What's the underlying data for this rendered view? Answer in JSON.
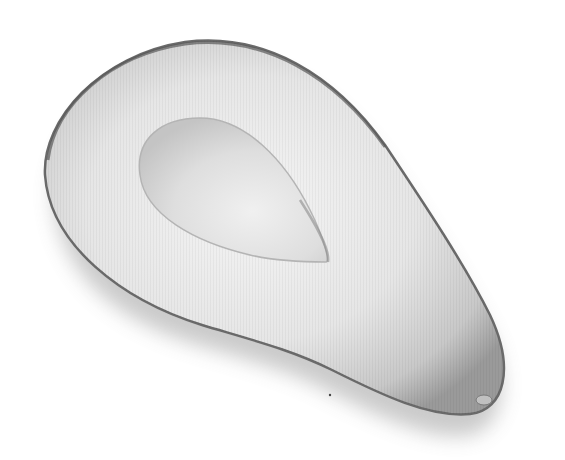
{
  "image": {
    "subject": "avocado half",
    "description": "Grayscale photo of a halved avocado with the pit removed, showing the hollow seed cavity",
    "colors": {
      "background": "#ffffff",
      "flesh_light": "#f2f2f2",
      "flesh_mid": "#d4d4d4",
      "skin_edge": "#6a6a6a",
      "cavity": "#dcdcdc",
      "shadow": "#9a9a9a"
    }
  }
}
